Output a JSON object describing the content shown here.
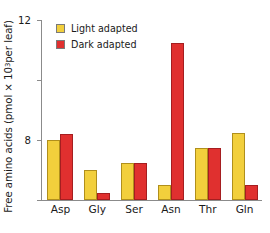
{
  "chart_data": {
    "type": "bar",
    "title": "",
    "xlabel": "",
    "ylabel": "Free amino acids (pmol × 10³ per leaf)",
    "ylabel_prefix": "Free amino acids (pmol × 10",
    "ylabel_exponent": "3",
    "ylabel_suffix": " per leaf)",
    "categories": [
      "Asp",
      "Gly",
      "Ser",
      "Asn",
      "Thr",
      "Gln"
    ],
    "series": [
      {
        "name": "Light adapted",
        "color": "#F2CF3C",
        "values": [
          4.0,
          2.0,
          2.5,
          1.0,
          3.5,
          4.5
        ]
      },
      {
        "name": "Dark adapted",
        "color": "#E0302F",
        "values": [
          4.4,
          0.5,
          2.5,
          10.5,
          3.5,
          1.0
        ]
      }
    ],
    "ylim": [
      0,
      12
    ],
    "yticks": [
      0,
      4,
      8,
      12
    ],
    "ytick_labels": [
      "0",
      "4",
      "8",
      "12"
    ],
    "grid": false,
    "legend_position": "top-left"
  },
  "legend": {
    "items": [
      {
        "label": "Light adapted",
        "color": "#F2CF3C"
      },
      {
        "label": "Dark adapted",
        "color": "#E0302F"
      }
    ]
  }
}
